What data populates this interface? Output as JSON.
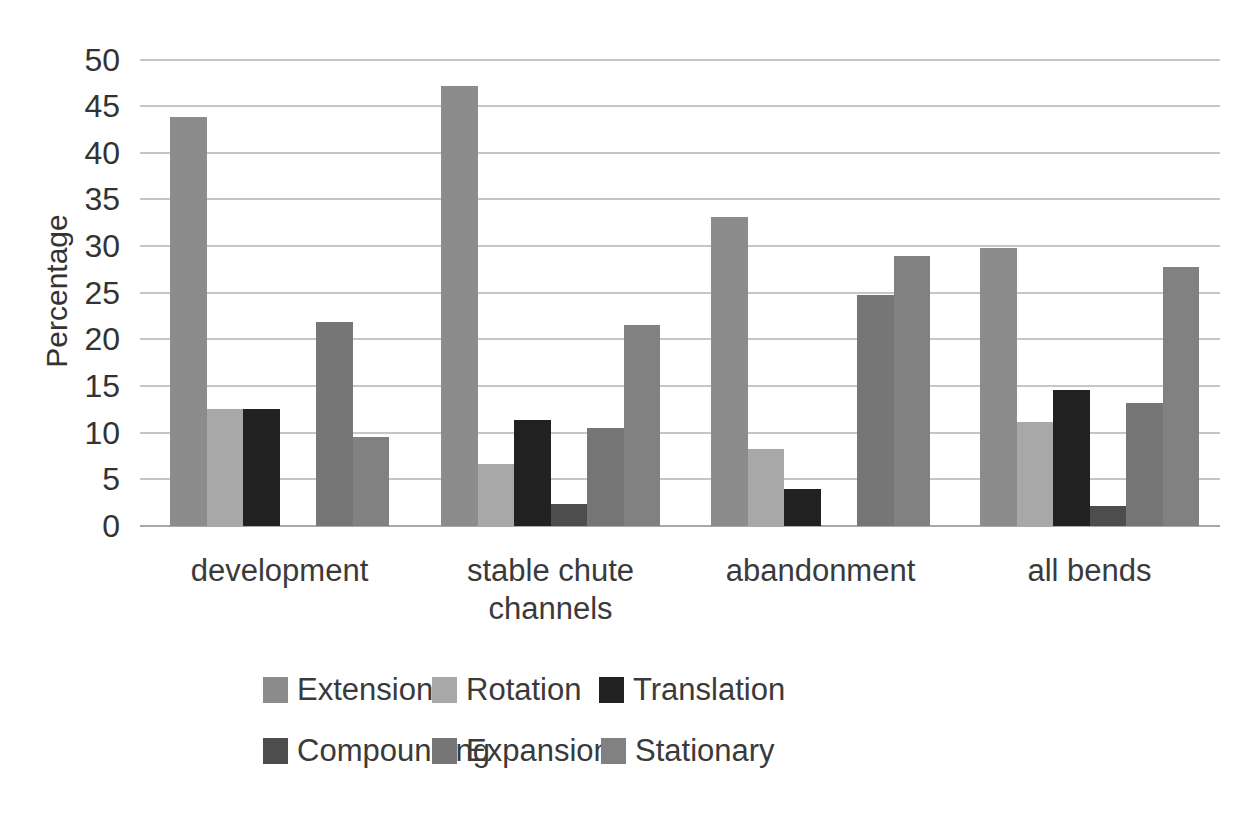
{
  "chart_data": {
    "type": "bar",
    "title": "",
    "xlabel": "",
    "ylabel": "Percentage",
    "ylim": [
      0,
      50
    ],
    "ytick_step": 5,
    "yticks": [
      0,
      5,
      10,
      15,
      20,
      25,
      30,
      35,
      40,
      45,
      50
    ],
    "grid": true,
    "legend_position": "bottom",
    "categories": [
      "development",
      "stable chute channels",
      "abandonment",
      "all bends"
    ],
    "series": [
      {
        "name": "Extension",
        "color": "#8C8C8C",
        "values": [
          43.8,
          47.2,
          33.1,
          29.8
        ]
      },
      {
        "name": "Rotation",
        "color": "#A8A8A8",
        "values": [
          12.5,
          6.6,
          8.3,
          11.1
        ]
      },
      {
        "name": "Translation",
        "color": "#212121",
        "values": [
          12.5,
          11.4,
          4.0,
          14.6
        ]
      },
      {
        "name": "Compounding",
        "color": "#4D4D4D",
        "values": [
          0,
          2.4,
          0,
          2.1
        ]
      },
      {
        "name": "Expansion",
        "color": "#767676",
        "values": [
          21.9,
          10.5,
          24.8,
          13.2
        ]
      },
      {
        "name": "Stationary",
        "color": "#818181",
        "values": [
          9.5,
          21.5,
          28.9,
          27.8
        ]
      }
    ]
  },
  "colors": {
    "background": "#FFFFFF",
    "gridline": "#C6C6C6",
    "axis_line": "#A8A8A8",
    "text": "#3A3A3A"
  }
}
